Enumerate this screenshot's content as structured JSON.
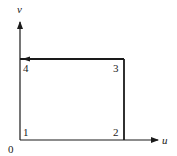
{
  "axes": {
    "x_label": "u",
    "y_label": "v",
    "origin_label": "0"
  },
  "vertices": [
    {
      "label": "1",
      "position": "bottom-left"
    },
    {
      "label": "2",
      "position": "bottom-right"
    },
    {
      "label": "3",
      "position": "top-right"
    },
    {
      "label": "4",
      "position": "top-left"
    }
  ],
  "path": {
    "order": [
      "1",
      "2",
      "3",
      "4",
      "1"
    ],
    "direction_arrow": "on edge 3→4 pointing toward 4"
  },
  "colors": {
    "line": "#1a1a1a",
    "background": "#ffffff"
  }
}
